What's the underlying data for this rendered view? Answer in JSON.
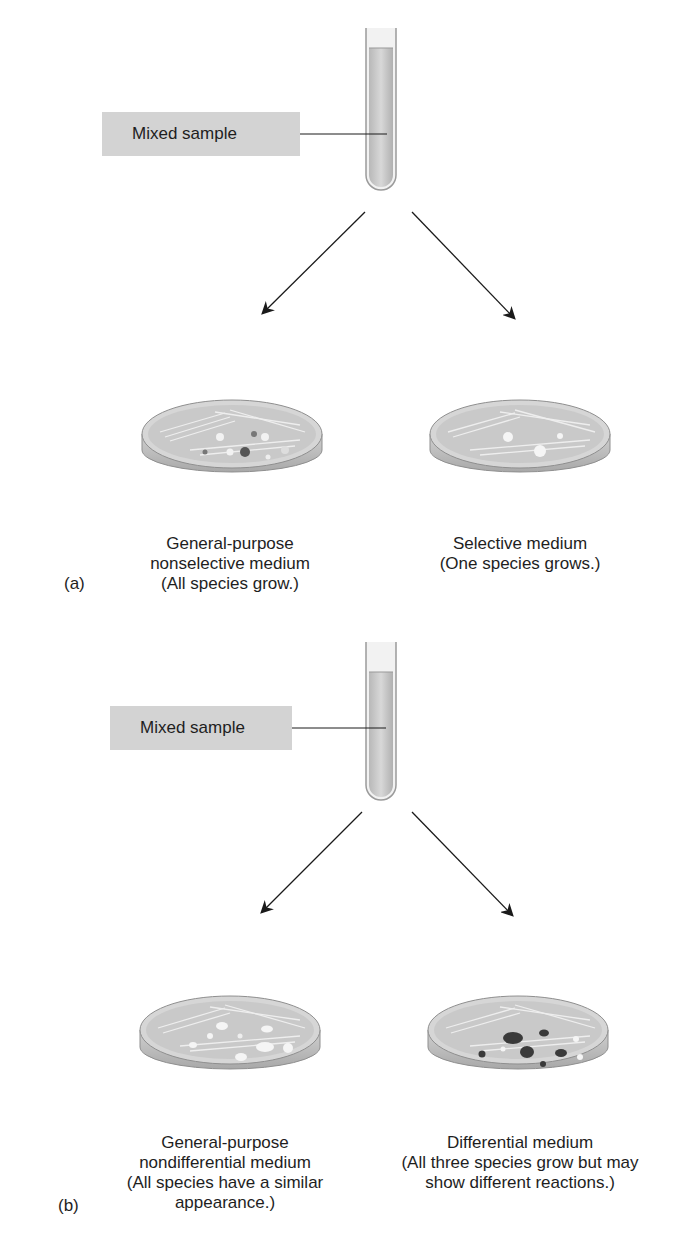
{
  "figure": {
    "panels": [
      {
        "letter": "(a)",
        "sample_label": "Mixed sample",
        "left_dish": {
          "title": "General-purpose",
          "line2": "nonselective medium",
          "line3": "(All species grow.)"
        },
        "right_dish": {
          "title": "Selective medium",
          "line2": "(One species grows.)"
        }
      },
      {
        "letter": "(b)",
        "sample_label": "Mixed sample",
        "left_dish": {
          "title": "General-purpose",
          "line2": "nondifferential medium",
          "line3": "(All species have a similar",
          "line4": "appearance.)"
        },
        "right_dish": {
          "title": "Differential medium",
          "line2": "(All three species grow but may",
          "line3": "show different reactions.)"
        }
      }
    ],
    "colors": {
      "label_box": "#d3d3d3",
      "tube_fill": "#c8c8c8",
      "dish_fill": "#d4d4d4",
      "dark_colony": "#3a3a3a",
      "light_colony": "#f4f4f4"
    }
  }
}
